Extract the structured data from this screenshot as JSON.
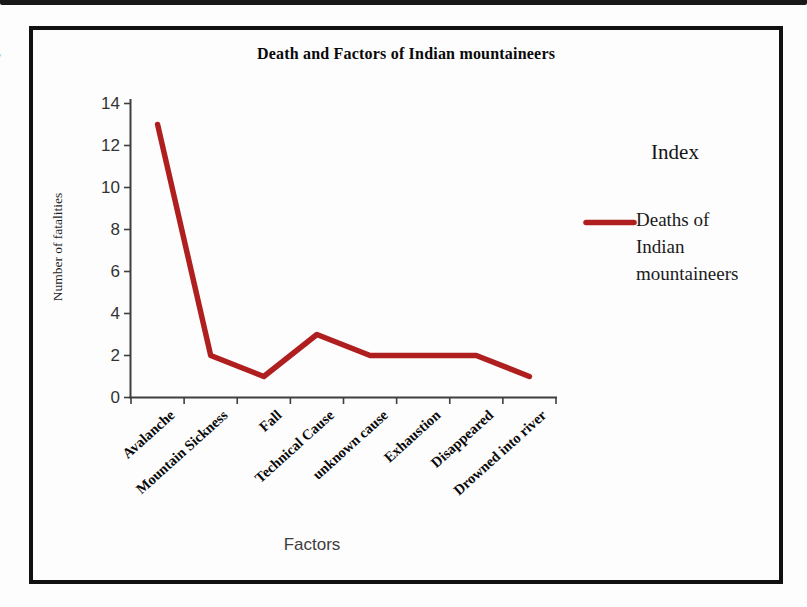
{
  "chart_data": {
    "type": "line",
    "title": "Death and Factors of Indian mountaineers",
    "categories": [
      "Avalanche",
      "Mountain Sickness",
      "Fall",
      "Technical Cause",
      "unknown cause",
      "Exhaustion",
      "Disappeared",
      "Drowned into river"
    ],
    "series": [
      {
        "name": "Deaths of Indian mountaineers",
        "values": [
          13,
          2,
          1,
          3,
          2,
          2,
          2,
          1
        ],
        "color": "#B01F1F"
      }
    ],
    "xlabel": "Factors",
    "ylabel": "Number of fatalities",
    "ylim": [
      0,
      14
    ],
    "ytick_step": 2,
    "grid": false,
    "legend_position": "right",
    "legend_title": "Index",
    "axis_color": "#3f3f3f"
  }
}
